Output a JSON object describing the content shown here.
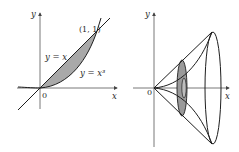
{
  "left_panel": {
    "axes": {
      "x_label": "x",
      "y_label": "y",
      "origin_label": "0"
    },
    "curves": [
      {
        "name": "line",
        "equation": "y = x"
      },
      {
        "name": "cubic",
        "equation": "y = x³"
      }
    ],
    "intersection_label": "(1, 1)",
    "shaded_region": "between y = x and y = x³ for 0 ≤ x ≤ 1",
    "colors": {
      "fill": "#a9a9a9",
      "stroke": "#1e1e1e"
    }
  },
  "right_panel": {
    "axes": {
      "x_label": "x",
      "y_label": "y",
      "origin_label": "0"
    },
    "solid": "solid of revolution of region about x-axis (cone with inner cusp surface)",
    "cross_section": "washer (shaded)",
    "colors": {
      "washer_fill": "#9a9a9a",
      "stroke": "#1e1e1e"
    }
  }
}
